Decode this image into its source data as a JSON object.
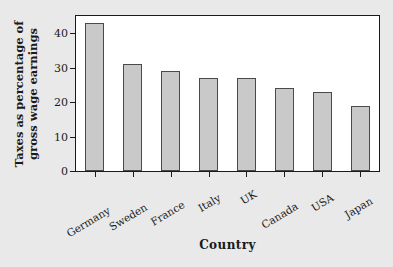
{
  "chart_data": {
    "type": "bar",
    "title": "",
    "subtitle": "",
    "xlabel": "Country",
    "ylabel": "Taxes as percentage of gross wage earnings",
    "ylabel_lines": [
      "Taxes as percentage of",
      "gross wage earnings"
    ],
    "categories": [
      "Germany",
      "Sweden",
      "France",
      "Italy",
      "UK",
      "Canada",
      "USA",
      "Japan"
    ],
    "values": [
      43,
      31,
      29,
      27,
      27,
      24,
      23,
      19
    ],
    "ylim": [
      0,
      45
    ],
    "yticks": [
      0,
      10,
      20,
      30,
      40
    ],
    "ytick_labels": [
      "0",
      "10",
      "20",
      "30",
      "40"
    ],
    "grid": false,
    "legend": null,
    "annotations": [],
    "bar_fill_color": "#c9c9c9",
    "bar_edge_color": "#4a4a4a",
    "plot_background": "#ffffff",
    "figure_background": "#e9e9e9",
    "axis_color": "#1a1a1a"
  }
}
